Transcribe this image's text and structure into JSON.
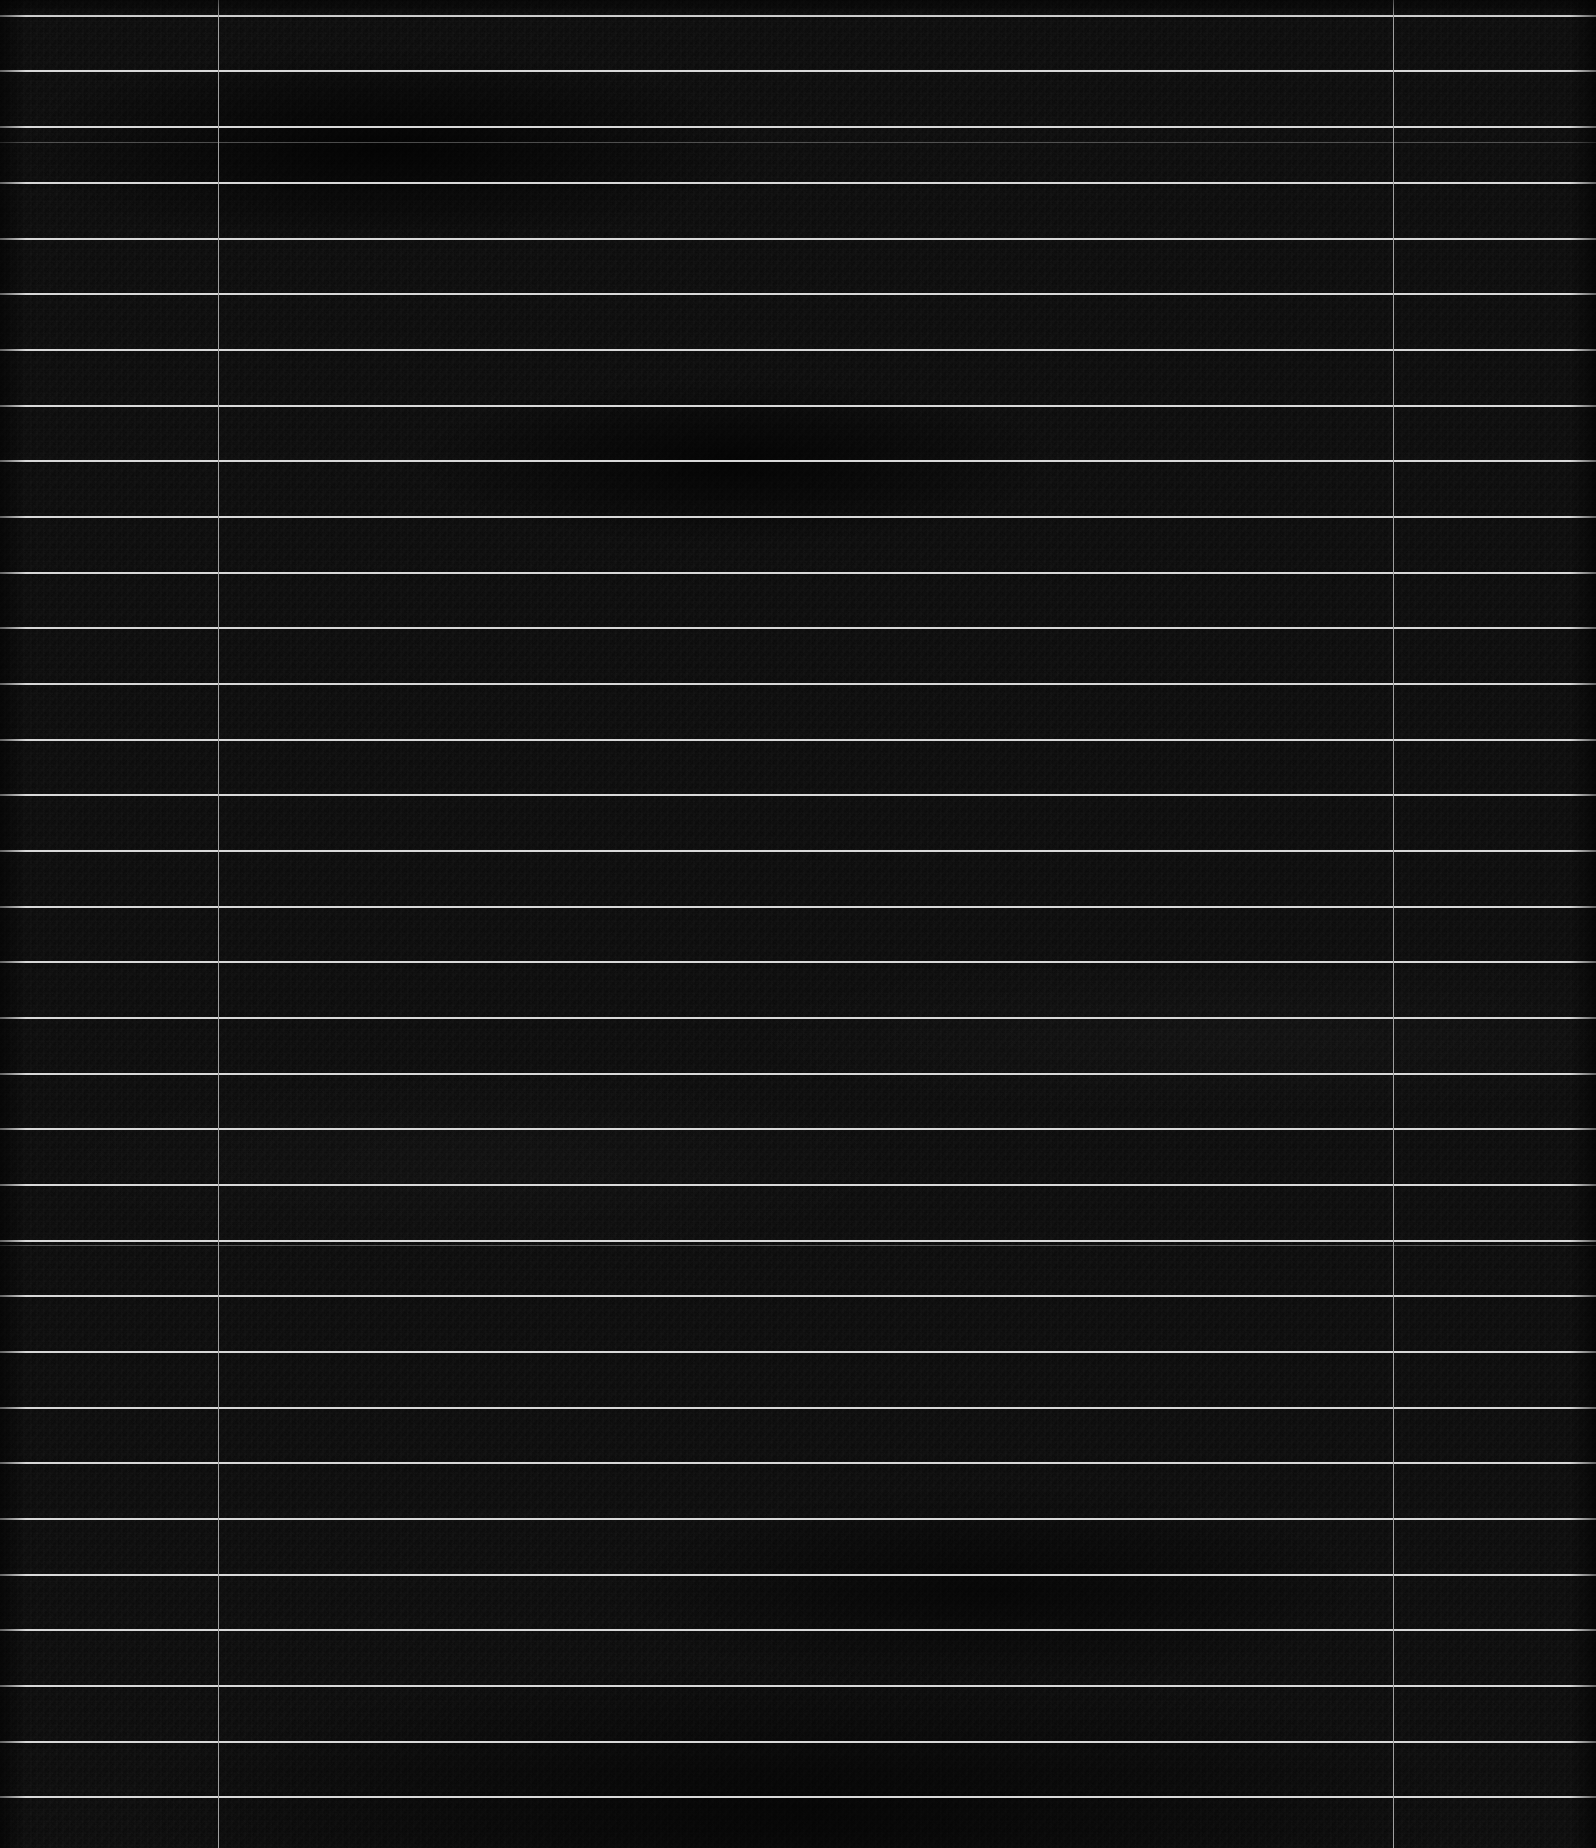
{
  "screen": {
    "name": "dark-grid-table",
    "width": 1596,
    "height": 1848,
    "background_color": "#0a0a0a",
    "description": "Severely underexposed screenshot of a dark tabular grid. No legible text is rendered; only row separator lines and two column divider lines are visible above the noise floor."
  },
  "grid": {
    "line_color": "#d8d8d8",
    "dim_line_color": "#bebebe",
    "column_divider_color": "#a0a0a0",
    "row_pitch": 55.6,
    "row_line_height": 2,
    "column_divider_x": [
      218,
      1393
    ],
    "row_line_y": [
      15,
      70,
      126,
      182,
      238,
      293,
      349,
      405,
      460,
      516,
      572,
      627,
      683,
      739,
      794,
      850,
      906,
      961,
      1017,
      1073,
      1128,
      1184,
      1240,
      1295,
      1351,
      1407,
      1462,
      1518,
      1574,
      1629,
      1685,
      1741,
      1796
    ],
    "dim_line_y": [
      142,
      1245
    ],
    "row_count": 33,
    "column_count": 3
  },
  "columns": [
    {
      "index": 0,
      "name": "column-left",
      "x": 0,
      "width": 218
    },
    {
      "index": 1,
      "name": "column-center",
      "x": 219,
      "width": 1174
    },
    {
      "index": 2,
      "name": "column-right",
      "x": 1394,
      "width": 202
    }
  ],
  "rows": [
    {
      "index": 0,
      "label": ""
    },
    {
      "index": 1,
      "label": ""
    },
    {
      "index": 2,
      "label": ""
    },
    {
      "index": 3,
      "label": ""
    },
    {
      "index": 4,
      "label": ""
    },
    {
      "index": 5,
      "label": ""
    },
    {
      "index": 6,
      "label": ""
    },
    {
      "index": 7,
      "label": ""
    },
    {
      "index": 8,
      "label": ""
    },
    {
      "index": 9,
      "label": ""
    },
    {
      "index": 10,
      "label": ""
    },
    {
      "index": 11,
      "label": ""
    },
    {
      "index": 12,
      "label": ""
    },
    {
      "index": 13,
      "label": ""
    },
    {
      "index": 14,
      "label": ""
    },
    {
      "index": 15,
      "label": ""
    },
    {
      "index": 16,
      "label": ""
    },
    {
      "index": 17,
      "label": ""
    },
    {
      "index": 18,
      "label": ""
    },
    {
      "index": 19,
      "label": ""
    },
    {
      "index": 20,
      "label": ""
    },
    {
      "index": 21,
      "label": ""
    },
    {
      "index": 22,
      "label": ""
    },
    {
      "index": 23,
      "label": ""
    },
    {
      "index": 24,
      "label": ""
    },
    {
      "index": 25,
      "label": ""
    },
    {
      "index": 26,
      "label": ""
    },
    {
      "index": 27,
      "label": ""
    },
    {
      "index": 28,
      "label": ""
    },
    {
      "index": 29,
      "label": ""
    },
    {
      "index": 30,
      "label": ""
    },
    {
      "index": 31,
      "label": ""
    }
  ]
}
